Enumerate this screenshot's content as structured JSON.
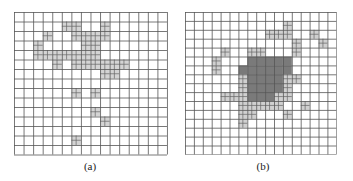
{
  "figure": {
    "panels": [
      {
        "id": "a",
        "caption": "(a)",
        "origin": [
          14,
          12
        ],
        "cols": 16,
        "rows": 15,
        "cell_w": 9.56,
        "cell_h": 9.5,
        "line_color": "#555555",
        "refined_fill": "#d4d4d4",
        "dense_fill": "#7a7a7a",
        "refined_cells": [
          [
            1,
            5
          ],
          [
            1,
            6
          ],
          [
            1,
            9
          ],
          [
            2,
            3
          ],
          [
            2,
            6
          ],
          [
            2,
            7
          ],
          [
            2,
            8
          ],
          [
            2,
            9
          ],
          [
            3,
            2
          ],
          [
            3,
            7
          ],
          [
            3,
            8
          ],
          [
            4,
            2
          ],
          [
            4,
            3
          ],
          [
            4,
            4
          ],
          [
            4,
            5
          ],
          [
            4,
            6
          ],
          [
            4,
            7
          ],
          [
            4,
            8
          ],
          [
            5,
            4
          ],
          [
            5,
            6
          ],
          [
            5,
            7
          ],
          [
            5,
            8
          ],
          [
            5,
            9
          ],
          [
            5,
            10
          ],
          [
            5,
            11
          ],
          [
            6,
            9
          ],
          [
            6,
            10
          ],
          [
            8,
            6
          ],
          [
            8,
            8
          ],
          [
            10,
            8
          ],
          [
            11,
            9
          ],
          [
            13,
            6
          ]
        ],
        "dense_cells": []
      },
      {
        "id": "b",
        "caption": "(b)",
        "origin": [
          185,
          12
        ],
        "cols": 17,
        "rows": 16,
        "cell_w": 8.9,
        "cell_h": 8.9,
        "line_color": "#555555",
        "refined_fill": "#d0d0d0",
        "dense_fill": "#7a7a7a",
        "refined_cells": [
          [
            1,
            11
          ],
          [
            2,
            9
          ],
          [
            2,
            10
          ],
          [
            2,
            11
          ],
          [
            2,
            14
          ],
          [
            3,
            12
          ],
          [
            3,
            15
          ],
          [
            4,
            4
          ],
          [
            4,
            7
          ],
          [
            4,
            8
          ],
          [
            4,
            12
          ],
          [
            5,
            3
          ],
          [
            6,
            3
          ],
          [
            7,
            6
          ],
          [
            7,
            11
          ],
          [
            7,
            12
          ],
          [
            8,
            6
          ],
          [
            8,
            11
          ],
          [
            9,
            4
          ],
          [
            9,
            5
          ],
          [
            9,
            6
          ],
          [
            9,
            10
          ],
          [
            9,
            11
          ],
          [
            10,
            6
          ],
          [
            10,
            7
          ],
          [
            10,
            8
          ],
          [
            10,
            9
          ],
          [
            10,
            10
          ],
          [
            10,
            13
          ],
          [
            11,
            6
          ],
          [
            11,
            7
          ],
          [
            11,
            11
          ],
          [
            12,
            6
          ]
        ],
        "dense_cells": [
          [
            5,
            7
          ],
          [
            5,
            8
          ],
          [
            5,
            9
          ],
          [
            5,
            10
          ],
          [
            5,
            11
          ],
          [
            6,
            6
          ],
          [
            6,
            7
          ],
          [
            6,
            8
          ],
          [
            6,
            9
          ],
          [
            6,
            10
          ],
          [
            6,
            11
          ],
          [
            7,
            7
          ],
          [
            7,
            8
          ],
          [
            7,
            9
          ],
          [
            7,
            10
          ],
          [
            8,
            7
          ],
          [
            8,
            8
          ],
          [
            8,
            9
          ],
          [
            8,
            10
          ],
          [
            9,
            7
          ],
          [
            9,
            8
          ],
          [
            9,
            9
          ]
        ]
      }
    ]
  }
}
